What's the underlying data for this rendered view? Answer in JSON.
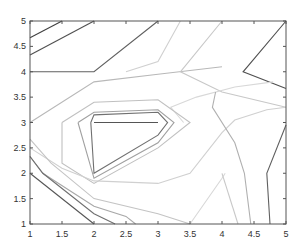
{
  "chart_data": {
    "type": "contour",
    "title": "",
    "xlabel": "",
    "ylabel": "",
    "xlim": [
      1,
      5
    ],
    "ylim": [
      1,
      5
    ],
    "grid": false,
    "x_ticks": [
      1,
      1.5,
      2,
      2.5,
      3,
      3.5,
      4,
      4.5,
      5
    ],
    "y_ticks": [
      1,
      1.5,
      2,
      2.5,
      3,
      3.5,
      4,
      4.5,
      5
    ],
    "x_tick_labels": [
      "1",
      "1.5",
      "2",
      "2.5",
      "3",
      "3.5",
      "4",
      "4.5",
      "5"
    ],
    "y_tick_labels": [
      "1",
      "1.5",
      "2",
      "2.5",
      "3",
      "3.5",
      "4",
      "4.5",
      "5"
    ],
    "contours": [
      {
        "shade": "#404040",
        "points": [
          [
            1,
            4.67
          ],
          [
            1.5,
            5
          ]
        ]
      },
      {
        "shade": "#505050",
        "points": [
          [
            1,
            4.33
          ],
          [
            2,
            5
          ]
        ]
      },
      {
        "shade": "#606060",
        "points": [
          [
            1,
            4
          ],
          [
            2,
            4
          ],
          [
            3,
            5
          ]
        ]
      },
      {
        "shade": "#b8b8b8",
        "points": [
          [
            1,
            3
          ],
          [
            2,
            3.8
          ],
          [
            3,
            3.95
          ],
          [
            4,
            4.1
          ]
        ]
      },
      {
        "shade": "#d0d0d0",
        "points": [
          [
            3.35,
            5
          ],
          [
            3,
            4.2
          ],
          [
            2.5,
            4.0
          ]
        ]
      },
      {
        "shade": "#c8c8c8",
        "points": [
          [
            4,
            5
          ],
          [
            3.35,
            4.0
          ],
          [
            4,
            3.6
          ],
          [
            5,
            3.3
          ]
        ]
      },
      {
        "shade": "#505050",
        "points": [
          [
            5,
            5
          ],
          [
            4.33,
            4.0
          ],
          [
            5,
            3.67
          ]
        ]
      },
      {
        "shade": "#d8d8d8",
        "points": [
          [
            4.8,
            3.8
          ],
          [
            4.2,
            3.7
          ],
          [
            3.6,
            3.5
          ],
          [
            3.2,
            3.3
          ],
          [
            3.4,
            3.0
          ]
        ]
      },
      {
        "shade": "#c0c0c0",
        "points": [
          [
            1.5,
            3.0
          ],
          [
            2,
            3.4
          ],
          [
            3,
            3.45
          ],
          [
            3.5,
            3.0
          ],
          [
            3,
            2.5
          ],
          [
            2,
            1.8
          ],
          [
            1.5,
            2.2
          ],
          [
            1.5,
            3.0
          ]
        ]
      },
      {
        "shade": "#a0a0a0",
        "points": [
          [
            1.75,
            3.0
          ],
          [
            2,
            3.2
          ],
          [
            3,
            3.25
          ],
          [
            3.25,
            3.0
          ],
          [
            3,
            2.6
          ],
          [
            2,
            1.9
          ],
          [
            1.75,
            3.0
          ]
        ]
      },
      {
        "shade": "#707070",
        "points": [
          [
            1.95,
            3.0
          ],
          [
            2,
            3.15
          ],
          [
            3,
            3.2
          ],
          [
            3.15,
            3.0
          ],
          [
            3,
            2.75
          ],
          [
            2,
            2.0
          ],
          [
            1.95,
            3.0
          ]
        ]
      },
      {
        "shade": "#555555",
        "points": [
          [
            2,
            3.0
          ],
          [
            3,
            3.0
          ]
        ]
      },
      {
        "shade": "#d0d0d0",
        "points": [
          [
            1,
            2.5
          ],
          [
            1.5,
            2.1
          ],
          [
            2,
            1.85
          ],
          [
            3,
            1.8
          ],
          [
            3.5,
            2.0
          ],
          [
            4,
            2.8
          ],
          [
            4.2,
            3.05
          ],
          [
            4.7,
            3.25
          ],
          [
            5,
            3.3
          ]
        ]
      },
      {
        "shade": "#c4c4c4",
        "points": [
          [
            1,
            2.67
          ],
          [
            1.33,
            2.2
          ],
          [
            2,
            1.5
          ],
          [
            3,
            1.2
          ],
          [
            3.5,
            1.0
          ]
        ]
      },
      {
        "shade": "#a8a8a8",
        "points": [
          [
            1,
            2.33
          ],
          [
            1.2,
            2.0
          ],
          [
            2,
            1.35
          ],
          [
            2.5,
            1.15
          ],
          [
            2.65,
            1.0
          ]
        ]
      },
      {
        "shade": "#707070",
        "points": [
          [
            1,
            2.33
          ],
          [
            1.2,
            2.0
          ],
          [
            2,
            1.2
          ],
          [
            2.33,
            1.0
          ]
        ]
      },
      {
        "shade": "#555555",
        "points": [
          [
            1,
            2.0
          ],
          [
            2,
            1.0
          ]
        ]
      },
      {
        "shade": "#d8d8d8",
        "points": [
          [
            3.5,
            1.0
          ],
          [
            4,
            1.9
          ],
          [
            4.05,
            2.0
          ]
        ]
      },
      {
        "shade": "#b0b0b0",
        "points": [
          [
            3.9,
            3.6
          ],
          [
            3.85,
            3.3
          ],
          [
            4.2,
            2.6
          ],
          [
            4.35,
            2.0
          ],
          [
            4.45,
            1.0
          ]
        ]
      },
      {
        "shade": "#c8c8c8",
        "points": [
          [
            4.25,
            1.0
          ],
          [
            4.0,
            2.0
          ]
        ]
      },
      {
        "shade": "#606060",
        "points": [
          [
            4.75,
            1.0
          ],
          [
            4.7,
            2.0
          ],
          [
            5,
            2.95
          ]
        ]
      }
    ]
  }
}
